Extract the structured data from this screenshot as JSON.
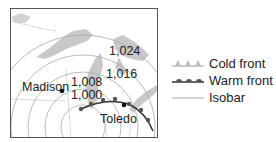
{
  "map": {
    "cities": [
      {
        "name": "Madison"
      },
      {
        "name": "Toledo"
      }
    ],
    "isobar_labels": [
      "1,024",
      "1,016",
      "1,008",
      "1,000"
    ]
  },
  "legend": {
    "items": [
      {
        "label": "Cold front",
        "icon": "cold-front-icon",
        "color": "#bdbdbd"
      },
      {
        "label": "Warm front",
        "icon": "warm-front-icon",
        "color": "#555555"
      },
      {
        "label": "Isobar",
        "icon": "isobar-line-icon",
        "color": "#aaaaaa"
      }
    ]
  },
  "colors": {
    "land_water": "#c8c8c8",
    "border": "#555555",
    "text": "#222222"
  }
}
